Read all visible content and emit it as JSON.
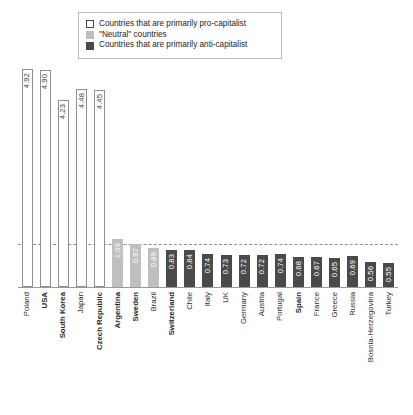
{
  "legend": {
    "items": [
      {
        "label": "Countries that are primarily pro-capitalist",
        "group": "pro",
        "color": "#ffffff"
      },
      {
        "label": "\"Neutral\" countries",
        "group": "neutral",
        "color": "#bfbfbf"
      },
      {
        "label": "Countries that are primarily anti-capitalist",
        "group": "anti",
        "color": "#4a4a4a"
      }
    ]
  },
  "chart_data": {
    "type": "bar",
    "title": "",
    "xlabel": "",
    "ylabel": "",
    "ylim": [
      0,
      5.2
    ],
    "grid": false,
    "legend_position": "top",
    "reference_line": 1.0,
    "categories": [
      "Poland",
      "USA",
      "South Korea",
      "Japan",
      "Czech Republic",
      "Argentina",
      "Sweden",
      "Brazil",
      "Switzerland",
      "Chile",
      "Italy",
      "UK",
      "Germany",
      "Austria",
      "Portugal",
      "Spain",
      "France",
      "Greece",
      "Russia",
      "Bosnia-Herzegovina",
      "Turkey"
    ],
    "values": [
      4.92,
      4.9,
      4.23,
      4.48,
      4.45,
      1.09,
      0.97,
      0.89,
      0.83,
      0.84,
      0.74,
      0.73,
      0.72,
      0.72,
      0.74,
      0.68,
      0.67,
      0.65,
      0.69,
      0.56,
      0.55
    ],
    "groups": [
      "pro",
      "pro",
      "pro",
      "pro",
      "pro",
      "neutral",
      "neutral",
      "neutral",
      "anti",
      "anti",
      "anti",
      "anti",
      "anti",
      "anti",
      "anti",
      "anti",
      "anti",
      "anti",
      "anti",
      "anti",
      "anti"
    ],
    "bold_labels": [
      "USA",
      "South Korea",
      "Czech Republic",
      "Argentina",
      "Sweden",
      "Switzerland",
      "Spain"
    ]
  }
}
